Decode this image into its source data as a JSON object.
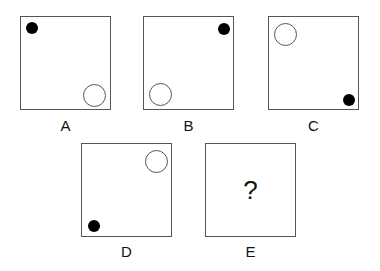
{
  "puzzle": {
    "panels": [
      {
        "label": "A",
        "filled_dot": "top-left",
        "hollow_circle": "bottom-right"
      },
      {
        "label": "B",
        "filled_dot": "top-right",
        "hollow_circle": "bottom-left"
      },
      {
        "label": "C",
        "filled_dot": "bottom-right",
        "hollow_circle": "top-left"
      },
      {
        "label": "D",
        "filled_dot": "bottom-left",
        "hollow_circle": "top-right"
      },
      {
        "label": "E",
        "content": "?"
      }
    ]
  }
}
